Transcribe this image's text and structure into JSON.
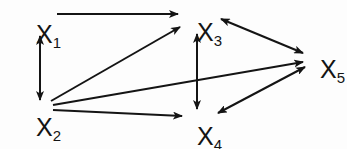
{
  "figure": {
    "type": "directed-graph",
    "title": "",
    "background_color": "#fdfdfd",
    "stroke_color": "#141414",
    "label_color": "#141414"
  },
  "nodes": [
    {
      "id": "X1",
      "label_base": "X",
      "label_sub": "1",
      "x": 36,
      "y": 22
    },
    {
      "id": "X2",
      "label_base": "X",
      "label_sub": "2",
      "x": 36,
      "y": 115
    },
    {
      "id": "X3",
      "label_base": "X",
      "label_sub": "3",
      "x": 197,
      "y": 20
    },
    {
      "id": "X4",
      "label_base": "X",
      "label_sub": "4",
      "x": 197,
      "y": 124
    },
    {
      "id": "X5",
      "label_base": "X",
      "label_sub": "5",
      "x": 320,
      "y": 57
    }
  ],
  "edges": [
    {
      "id": "e-x1-x3",
      "from": "X1",
      "to": "X3",
      "arrow": "single",
      "x1": 57,
      "y1": 14,
      "x2": 178,
      "y2": 14
    },
    {
      "id": "e-x1-x2",
      "from": "X1",
      "to": "X2",
      "arrow": "double",
      "x1": 40,
      "y1": 36,
      "x2": 40,
      "y2": 100
    },
    {
      "id": "e-x2-x3",
      "from": "X2",
      "to": "X3",
      "arrow": "single",
      "x1": 51,
      "y1": 101,
      "x2": 180,
      "y2": 27
    },
    {
      "id": "e-x2-x5",
      "from": "X2",
      "to": "X5",
      "arrow": "single",
      "x1": 53,
      "y1": 105,
      "x2": 303,
      "y2": 62
    },
    {
      "id": "e-x2-x4",
      "from": "X2",
      "to": "X4",
      "arrow": "single",
      "x1": 53,
      "y1": 110,
      "x2": 182,
      "y2": 116
    },
    {
      "id": "e-x3-x4",
      "from": "X3",
      "to": "X4",
      "arrow": "double",
      "x1": 197,
      "y1": 34,
      "x2": 197,
      "y2": 109
    },
    {
      "id": "e-x3-x5",
      "from": "X3",
      "to": "X5",
      "arrow": "double",
      "x1": 221,
      "y1": 19,
      "x2": 303,
      "y2": 53
    },
    {
      "id": "e-x4-x5",
      "from": "X4",
      "to": "X5",
      "arrow": "double",
      "x1": 218,
      "y1": 113,
      "x2": 305,
      "y2": 67
    }
  ]
}
